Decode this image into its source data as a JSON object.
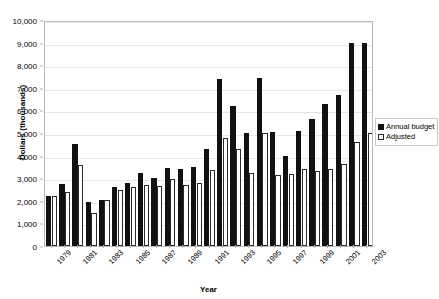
{
  "chart_data": {
    "type": "bar",
    "title": "",
    "xlabel": "Year",
    "ylabel": "Dollars (thousands)",
    "ylim": [
      0,
      10000
    ],
    "ytick_labels": [
      "10,000",
      "9,000",
      "8,000",
      "7,000",
      "6,000",
      "5,000",
      "4,000",
      "3,000",
      "2,000",
      "1,000",
      "0"
    ],
    "ytick_values": [
      10000,
      9000,
      8000,
      7000,
      6000,
      5000,
      4000,
      3000,
      2000,
      1000,
      0
    ],
    "grid": true,
    "legend_position": "right",
    "categories": [
      "1979",
      "1980",
      "1981",
      "1982",
      "1983",
      "1984",
      "1985",
      "1986",
      "1987",
      "1988",
      "1989",
      "1990",
      "1991",
      "1992",
      "1993",
      "1994",
      "1995",
      "1996",
      "1997",
      "1998",
      "1999",
      "2000",
      "2001",
      "2002",
      "2003"
    ],
    "xtick_labels_shown": [
      "1979",
      "1981",
      "1983",
      "1985",
      "1987",
      "1989",
      "1991",
      "1993",
      "1995",
      "1997",
      "1999",
      "2001",
      "2003"
    ],
    "series": [
      {
        "name": "Annual budget",
        "color": "#111111",
        "values": [
          2200,
          2750,
          4500,
          1950,
          2050,
          2600,
          2800,
          3250,
          3000,
          3450,
          3400,
          3500,
          4300,
          7400,
          6200,
          5000,
          7450,
          5050,
          4000,
          5100,
          5600,
          6300,
          6700,
          9000,
          9000
        ]
      },
      {
        "name": "Adjusted",
        "color": "#ffffff",
        "values": [
          2200,
          2400,
          3600,
          1450,
          2050,
          2500,
          2600,
          2700,
          2650,
          2950,
          2700,
          2800,
          3350,
          4800,
          4300,
          3250,
          5000,
          3150,
          3200,
          3400,
          3300,
          3400,
          3650,
          4600,
          5000
        ]
      }
    ]
  },
  "legend": {
    "entries": [
      {
        "label": "Annual budget",
        "swatch": "filled-square-icon"
      },
      {
        "label": "Adjusted",
        "swatch": "hollow-square-icon"
      }
    ]
  },
  "axes": {
    "x_title": "Year",
    "y_title": "Dollars (thousands)"
  }
}
